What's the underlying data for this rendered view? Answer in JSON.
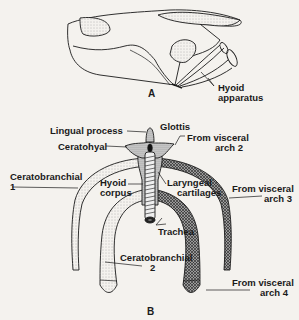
{
  "figure": {
    "panels": [
      {
        "id": "A",
        "label": "A",
        "description": "Lateral view of skull with hyoid apparatus",
        "annotations": [
          {
            "text_line1": "Hyoid",
            "text_line2": "apparatus"
          }
        ]
      },
      {
        "id": "B",
        "label": "B",
        "description": "Ventral view of hyoid apparatus and larynx",
        "annotations": [
          {
            "text": "Lingual process"
          },
          {
            "text": "Glottis"
          },
          {
            "text_line1": "From visceral",
            "text_line2": "arch 2"
          },
          {
            "text": "Ceratohyal"
          },
          {
            "text_line1": "Ceratobranchial",
            "text_line2": "1"
          },
          {
            "text_line1": "Hyoid",
            "text_line2": "corpus"
          },
          {
            "text_line1": "Laryngeal",
            "text_line2": "cartilages"
          },
          {
            "text_line1": "From visceral",
            "text_line2": "arch 3"
          },
          {
            "text": "Trachea"
          },
          {
            "text_line1": "Ceratobranchial",
            "text_line2": "2"
          },
          {
            "text_line1": "From visceral",
            "text_line2": "arch 4"
          }
        ]
      }
    ]
  },
  "colors": {
    "background": "#f4f2ee",
    "ink": "#1a1a1a",
    "stipple": "#b8b4ac"
  }
}
